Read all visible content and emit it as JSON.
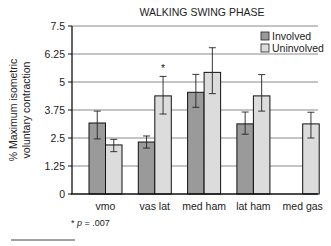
{
  "chart_data": {
    "type": "bar",
    "title": "WALKING SWING PHASE",
    "xlabel": "",
    "ylabel_lines": [
      "% Maximum isometric",
      "voluntary contraction"
    ],
    "ylim": [
      0,
      7.5
    ],
    "yticks": [
      "0",
      "1.25",
      "2.5",
      "3.75",
      "5",
      "6.25",
      "7.5"
    ],
    "ytick_values": [
      0,
      1.25,
      2.5,
      3.75,
      5,
      6.25,
      7.5
    ],
    "grid": true,
    "legend_position": "top-right",
    "categories": [
      "vmo",
      "vas lat",
      "med ham",
      "lat ham",
      "med gas"
    ],
    "series": [
      {
        "name": "Involved",
        "color": "#9a9a9a",
        "values": [
          3.17,
          2.32,
          4.54,
          3.13,
          null
        ],
        "err_low": [
          2.46,
          2.05,
          3.87,
          2.67,
          null
        ],
        "err_high": [
          3.7,
          2.59,
          5.34,
          3.66,
          null
        ]
      },
      {
        "name": "Uninvolved",
        "color": "#dcdcdc",
        "values": [
          2.19,
          4.38,
          5.43,
          4.38,
          3.13
        ],
        "err_low": [
          1.89,
          3.57,
          4.48,
          3.7,
          2.5
        ],
        "err_high": [
          2.44,
          5.25,
          6.53,
          5.33,
          3.65
        ]
      }
    ],
    "annotations": [
      {
        "text": "*",
        "category": "vas lat",
        "series": "Uninvolved"
      }
    ],
    "footnote_prefix": "* ",
    "footnote_p": "p",
    "footnote_rest": " = .007"
  }
}
